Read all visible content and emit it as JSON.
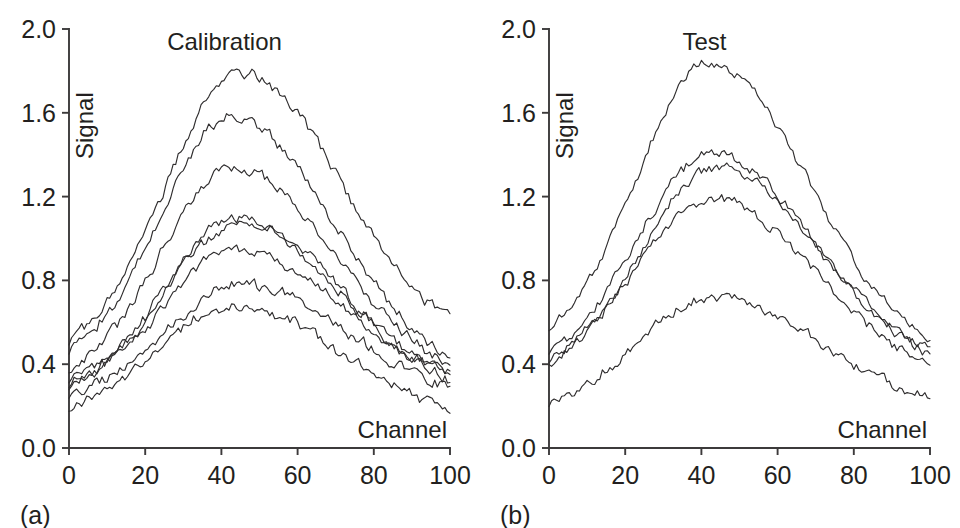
{
  "figure": {
    "background_color": "#ffffff",
    "ink_color": "#231f20",
    "curve_color": "#2f2d2e",
    "caption_fragment": ""
  },
  "chart_data": [
    {
      "type": "line",
      "panel_letter": "(a)",
      "title": "Calibration",
      "xlabel": "Channel",
      "ylabel": "Signal",
      "xlim": [
        0,
        100
      ],
      "ylim": [
        0.0,
        2.0
      ],
      "xticks": [
        0,
        20,
        40,
        60,
        80,
        100
      ],
      "xtick_labels": [
        "0",
        "20",
        "40",
        "60",
        "80",
        "100"
      ],
      "yticks": [
        0.0,
        0.4,
        0.8,
        1.2,
        1.6,
        2.0
      ],
      "ytick_labels": [
        "0.0",
        "0.4",
        "0.8",
        "1.2",
        "1.6",
        "2.0"
      ],
      "grid": false,
      "legend": "none",
      "n_series": 8,
      "noise_amplitude": 0.021,
      "series": [
        {
          "name": "calibration-1",
          "peak_value": 1.79,
          "peak_channel": 45,
          "start_value": 0.42,
          "end_value": 0.48,
          "left_width": 30,
          "right_width": 40,
          "seed": 11
        },
        {
          "name": "calibration-2",
          "peak_value": 1.58,
          "peak_channel": 43,
          "start_value": 0.38,
          "end_value": 0.33,
          "left_width": 29,
          "right_width": 40,
          "seed": 23
        },
        {
          "name": "calibration-3",
          "peak_value": 1.34,
          "peak_channel": 43,
          "start_value": 0.3,
          "end_value": 0.29,
          "left_width": 29,
          "right_width": 41,
          "seed": 37
        },
        {
          "name": "calibration-4",
          "peak_value": 1.1,
          "peak_channel": 44,
          "start_value": 0.24,
          "end_value": 0.26,
          "left_width": 29,
          "right_width": 41,
          "seed": 41
        },
        {
          "name": "calibration-5",
          "peak_value": 1.07,
          "peak_channel": 45,
          "start_value": 0.27,
          "end_value": 0.24,
          "left_width": 30,
          "right_width": 40,
          "seed": 53
        },
        {
          "name": "calibration-6",
          "peak_value": 0.94,
          "peak_channel": 44,
          "start_value": 0.26,
          "end_value": 0.28,
          "left_width": 30,
          "right_width": 42,
          "seed": 67
        },
        {
          "name": "calibration-7",
          "peak_value": 0.78,
          "peak_channel": 46,
          "start_value": 0.22,
          "end_value": 0.22,
          "left_width": 31,
          "right_width": 41,
          "seed": 79
        },
        {
          "name": "calibration-8",
          "peak_value": 0.68,
          "peak_channel": 43,
          "start_value": 0.15,
          "end_value": 0.11,
          "left_width": 30,
          "right_width": 43,
          "seed": 89
        }
      ]
    },
    {
      "type": "line",
      "panel_letter": "(b)",
      "title": "Test",
      "xlabel": "Channel",
      "ylabel": "Signal",
      "xlim": [
        0,
        100
      ],
      "ylim": [
        0.0,
        2.0
      ],
      "xticks": [
        0,
        20,
        40,
        60,
        80,
        100
      ],
      "xtick_labels": [
        "0",
        "20",
        "40",
        "60",
        "80",
        "100"
      ],
      "yticks": [
        0.0,
        0.4,
        0.8,
        1.2,
        1.6,
        2.0
      ],
      "ytick_labels": [
        "0.0",
        "0.4",
        "0.8",
        "1.2",
        "1.6",
        "2.0"
      ],
      "grid": false,
      "legend": "none",
      "n_series": 5,
      "noise_amplitude": 0.019,
      "series": [
        {
          "name": "test-1",
          "peak_value": 1.84,
          "peak_channel": 42,
          "start_value": 0.46,
          "end_value": 0.4,
          "left_width": 29,
          "right_width": 40,
          "seed": 101
        },
        {
          "name": "test-2",
          "peak_value": 1.41,
          "peak_channel": 43,
          "start_value": 0.37,
          "end_value": 0.35,
          "left_width": 30,
          "right_width": 40,
          "seed": 113
        },
        {
          "name": "test-3",
          "peak_value": 1.34,
          "peak_channel": 44,
          "start_value": 0.33,
          "end_value": 0.36,
          "left_width": 30,
          "right_width": 41,
          "seed": 127
        },
        {
          "name": "test-4",
          "peak_value": 1.19,
          "peak_channel": 43,
          "start_value": 0.34,
          "end_value": 0.31,
          "left_width": 31,
          "right_width": 41,
          "seed": 139
        },
        {
          "name": "test-5",
          "peak_value": 0.72,
          "peak_channel": 43,
          "start_value": 0.16,
          "end_value": 0.17,
          "left_width": 31,
          "right_width": 43,
          "seed": 151
        }
      ]
    }
  ]
}
